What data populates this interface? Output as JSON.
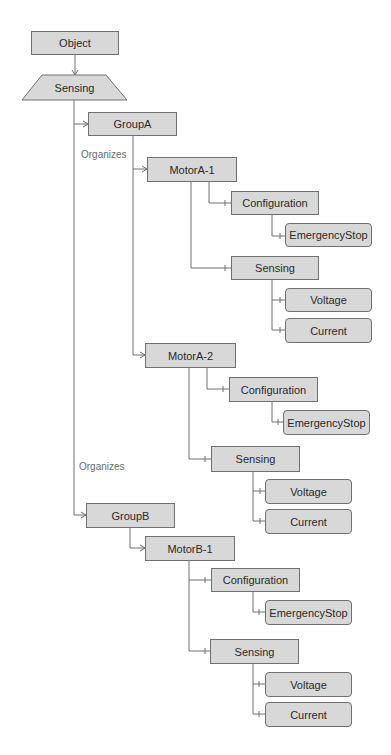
{
  "diagram": {
    "root": "Object",
    "sensing_root": "Sensing",
    "edge_label_1": "Organizes",
    "edge_label_2": "Organizes",
    "groups": [
      {
        "name": "GroupA",
        "motors": [
          {
            "name": "MotorA-1",
            "configuration": "Configuration",
            "config_children": [
              "EmergencyStop"
            ],
            "sensing": "Sensing",
            "sensing_children": [
              "Voltage",
              "Current"
            ]
          },
          {
            "name": "MotorA-2",
            "configuration": "Configuration",
            "config_children": [
              "EmergencyStop"
            ],
            "sensing": "Sensing",
            "sensing_children": [
              "Voltage",
              "Current"
            ]
          }
        ]
      },
      {
        "name": "GroupB",
        "motors": [
          {
            "name": "MotorB-1",
            "configuration": "Configuration",
            "config_children": [
              "EmergencyStop"
            ],
            "sensing": "Sensing",
            "sensing_children": [
              "Voltage",
              "Current"
            ]
          }
        ]
      }
    ],
    "colors": {
      "node_fill": "#d8d8d8",
      "node_border": "#707070",
      "line": "#707070",
      "label": "#6a6a6a"
    }
  }
}
